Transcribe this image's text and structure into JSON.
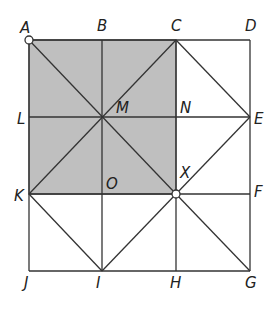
{
  "diagram": {
    "shaded_region": {
      "vertices": [
        "A",
        "C",
        "X",
        "K"
      ],
      "color": "#bfbfbf"
    },
    "points": [
      {
        "name": "A",
        "x": 29,
        "y": 40,
        "lx": 20,
        "ly": 33,
        "marked": true
      },
      {
        "name": "B",
        "x": 102,
        "y": 40,
        "lx": 97,
        "ly": 31
      },
      {
        "name": "C",
        "x": 176,
        "y": 40,
        "lx": 171,
        "ly": 31
      },
      {
        "name": "D",
        "x": 250,
        "y": 40,
        "lx": 245,
        "ly": 31
      },
      {
        "name": "L",
        "x": 29,
        "y": 117,
        "lx": 17,
        "ly": 124
      },
      {
        "name": "M",
        "x": 102,
        "y": 117,
        "lx": 116,
        "ly": 113
      },
      {
        "name": "N",
        "x": 176,
        "y": 117,
        "lx": 180,
        "ly": 113
      },
      {
        "name": "E",
        "x": 250,
        "y": 117,
        "lx": 254,
        "ly": 124
      },
      {
        "name": "K",
        "x": 29,
        "y": 194,
        "lx": 14,
        "ly": 201
      },
      {
        "name": "O",
        "x": 102,
        "y": 194,
        "lx": 106,
        "ly": 189
      },
      {
        "name": "X",
        "x": 176,
        "y": 194,
        "lx": 180,
        "ly": 178,
        "marked": true
      },
      {
        "name": "F",
        "x": 250,
        "y": 194,
        "lx": 254,
        "ly": 197
      },
      {
        "name": "J",
        "x": 29,
        "y": 271,
        "lx": 24,
        "ly": 288
      },
      {
        "name": "I",
        "x": 102,
        "y": 271,
        "lx": 96,
        "ly": 288
      },
      {
        "name": "H",
        "x": 176,
        "y": 271,
        "lx": 170,
        "ly": 288
      },
      {
        "name": "G",
        "x": 250,
        "y": 271,
        "lx": 245,
        "ly": 288
      }
    ],
    "segments": [
      [
        "A",
        "D"
      ],
      [
        "L",
        "E"
      ],
      [
        "K",
        "F"
      ],
      [
        "J",
        "G"
      ],
      [
        "A",
        "J"
      ],
      [
        "B",
        "I"
      ],
      [
        "C",
        "H"
      ],
      [
        "D",
        "G"
      ],
      [
        "A",
        "X"
      ],
      [
        "C",
        "K"
      ],
      [
        "C",
        "E"
      ],
      [
        "E",
        "X"
      ],
      [
        "K",
        "I"
      ],
      [
        "I",
        "X"
      ],
      [
        "X",
        "G"
      ]
    ]
  }
}
